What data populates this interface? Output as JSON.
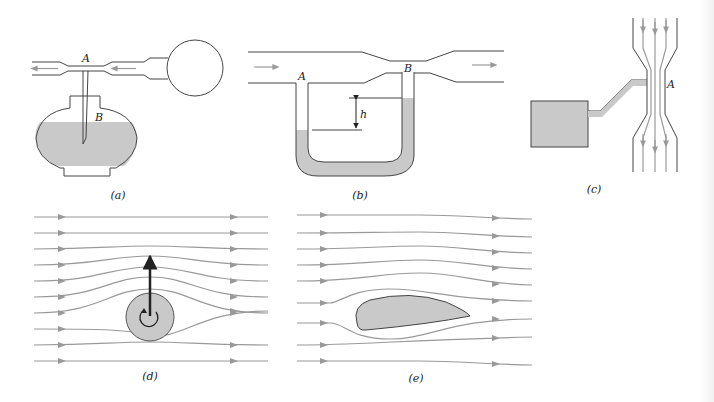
{
  "figure": {
    "panels": [
      {
        "id": "a",
        "caption": "(a)",
        "description": "Atomizer / perfume sprayer: squeeze bulb forces air through constricted tube past point A; tube dips into liquid reservoir at B",
        "labels": [
          "A",
          "B"
        ]
      },
      {
        "id": "b",
        "caption": "(b)",
        "description": "Venturi tube with U-tube manometer connecting wide section A and narrow section B; height difference h",
        "labels": [
          "A",
          "B",
          "h"
        ]
      },
      {
        "id": "c",
        "caption": "(c)",
        "description": "Constricted vertical flow with side tube from tank to narrow point A",
        "labels": [
          "A"
        ]
      },
      {
        "id": "d",
        "caption": "(d)",
        "description": "Streamlines around a spinning cylinder (Magnus effect) with upward lift arrow",
        "labels": []
      },
      {
        "id": "e",
        "caption": "(e)",
        "description": "Streamlines around an airfoil (wing) section",
        "labels": []
      }
    ],
    "colors": {
      "fluid_fill": "#c9c9c9",
      "streamline": "#999999",
      "outline": "#444444",
      "lift_arrow": "#222222"
    }
  }
}
